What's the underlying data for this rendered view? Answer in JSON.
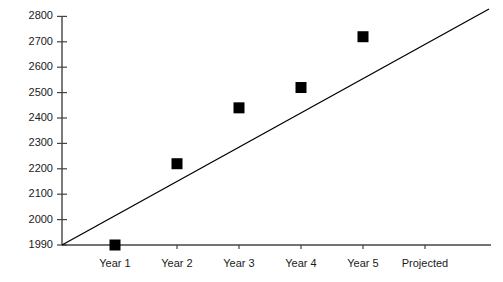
{
  "chart_data": {
    "type": "scatter",
    "title": "",
    "subtitle": "",
    "xlabel": "",
    "ylabel": "",
    "categories": [
      "Year 1",
      "Year 2",
      "Year 3",
      "Year 4",
      "Year 5",
      "Projected"
    ],
    "series": [
      {
        "name": "Observed",
        "marker": "filled-square",
        "color": "#000000",
        "values": [
          1990,
          2220,
          2440,
          2520,
          2720,
          2900
        ]
      },
      {
        "name": "Trend line",
        "type": "line",
        "color": "#000000",
        "endpoints": [
          {
            "x_category_index": 0.0,
            "value": 1990
          },
          {
            "x_category_index": 6.1,
            "value": 2925
          }
        ]
      }
    ],
    "y_ticks": [
      1990,
      2000,
      2100,
      2200,
      2300,
      2400,
      2500,
      2600,
      2700,
      2800,
      2900
    ],
    "y_tick_labels": [
      "1990",
      "2000",
      "2100",
      "2200",
      "2300",
      "2400",
      "2500",
      "2600",
      "2700",
      "2800",
      "2900"
    ],
    "ylim": [
      1990,
      2900
    ],
    "grid": false,
    "legend": "none",
    "axis_color": "#444444",
    "plot_background": "#ffffff"
  },
  "geometry": {
    "axis_x_px": 62,
    "axis_top_px": 16,
    "axis_bottom_px": 245,
    "axis_right_px": 491,
    "tick_step_px": 25.4,
    "category_x_px": [
      115,
      177,
      239,
      301,
      363,
      425
    ],
    "marker_size_px": 11,
    "line_start": {
      "x": 62,
      "y": 245
    },
    "line_end": {
      "x": 489,
      "y": 9
    }
  }
}
